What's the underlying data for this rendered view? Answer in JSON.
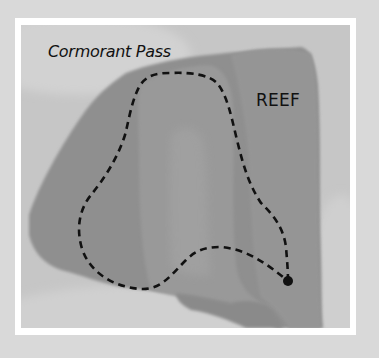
{
  "map": {
    "labels": {
      "pass": "Cormorant Pass",
      "reef": "REEF"
    },
    "route": {
      "style": "dashed",
      "end_marker": "filled-dot"
    },
    "colors": {
      "page_background": "#d9d9d9",
      "frame": "#ffffff",
      "water": "#c9c9c9",
      "land_dark": "#8e8e8e",
      "land_mid": "#999999",
      "land_light": "#a3a3a3",
      "route": "#111111"
    }
  }
}
